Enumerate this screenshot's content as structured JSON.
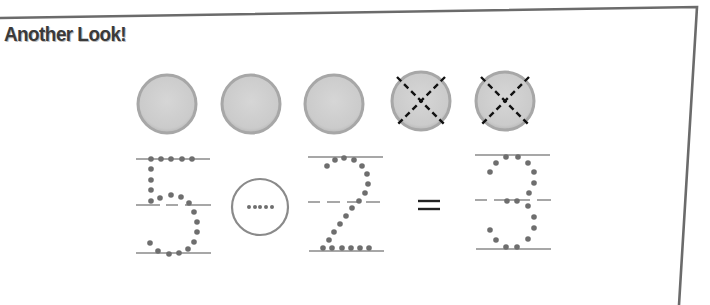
{
  "section": {
    "title": "Another Look!"
  },
  "counters": {
    "total": 5,
    "crossed_out": 2,
    "remaining": 3,
    "items": [
      {
        "state": "plain"
      },
      {
        "state": "plain"
      },
      {
        "state": "plain"
      },
      {
        "state": "crossed"
      },
      {
        "state": "crossed"
      }
    ],
    "fill_color": "#cfcfcf",
    "rim_color": "#a9a9a9",
    "cross_color": "#111111"
  },
  "equation": {
    "minuend": "5",
    "operator_blank": "(circle to fill in)",
    "subtrahend": "2",
    "equals": "=",
    "result": "3",
    "dot_color": "#6e6e6e",
    "guide_line_color": "#8a8a8a"
  },
  "frame": {
    "border_color": "#6b6b6b"
  }
}
